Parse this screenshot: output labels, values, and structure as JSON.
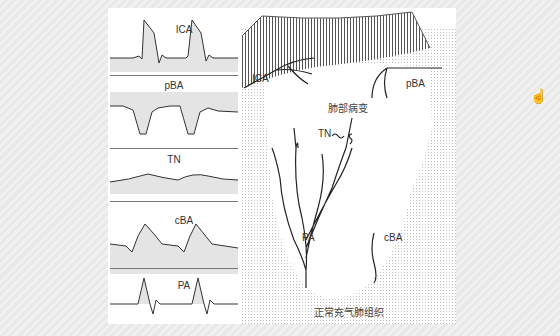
{
  "waveforms": [
    {
      "label": "ICA"
    },
    {
      "label": "pBA"
    },
    {
      "label": "TN"
    },
    {
      "label": "cBA"
    },
    {
      "label": "PA"
    }
  ],
  "diagram": {
    "labels": {
      "ica": "ICA",
      "pba": "pBA",
      "tn": "TN",
      "pa": "PA",
      "cba": "cBA",
      "lesion": "肺部病变",
      "normal": "正常充气肺组织"
    }
  },
  "colors": {
    "wave_fill": "#e4e4e4",
    "line": "#333333",
    "stipple": "#bdbdbd"
  }
}
